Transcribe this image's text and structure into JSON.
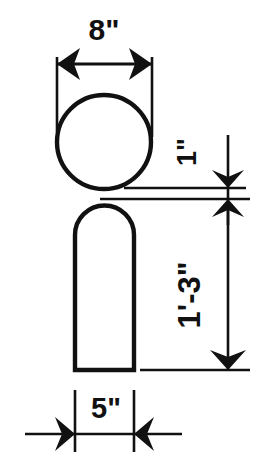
{
  "drawing": {
    "title": "Bollard dimension drawing",
    "background_color": "#ffffff",
    "line_color": "#111111",
    "dimensions": {
      "width_top": "8\"",
      "gap": "1\"",
      "height": "1'-3\"",
      "width_bottom": "5\""
    },
    "labels": {
      "top_width_label": "8\"",
      "gap_label": "1\"",
      "post_height_label": "1'-3\"",
      "base_width_label": "5\""
    },
    "views": {
      "plan_view_name": "circle-plan-view",
      "elevation_view_name": "rounded-post-elevation"
    }
  }
}
